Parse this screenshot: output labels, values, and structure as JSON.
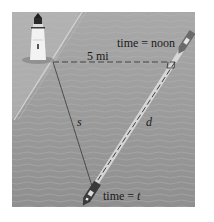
{
  "figure": {
    "type": "diagram",
    "labels": {
      "time_noon": "time = noon",
      "distance": "5 mi",
      "s": "s",
      "d": "d",
      "time_t": "time = t"
    },
    "points": {
      "lighthouse": [
        53,
        62
      ],
      "right_angle_corner": [
        175,
        62
      ],
      "ship_at_t": [
        92,
        190
      ]
    },
    "colors": {
      "sea": "#9a9a9a",
      "shore": "#b5b5b5",
      "line": "#2b2b2b",
      "path_highlight": "#e0e0e0"
    }
  }
}
